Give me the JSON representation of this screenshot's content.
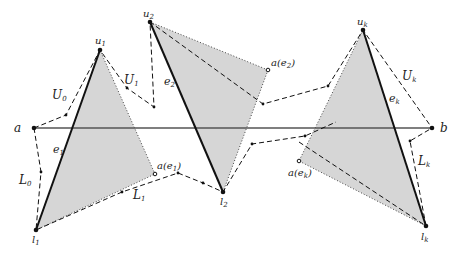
{
  "diagram": {
    "colors": {
      "fill": "#d6d6d6",
      "stroke": "#111111",
      "axis": "#555555"
    },
    "points": {
      "a": [
        34,
        128
      ],
      "b": [
        432,
        128
      ],
      "u1": [
        100,
        50
      ],
      "l1": [
        36,
        230
      ],
      "u2": [
        150,
        22
      ],
      "l2": [
        223,
        192
      ],
      "uk": [
        363,
        30
      ],
      "lk": [
        426,
        226
      ],
      "a_e1": [
        155,
        174
      ],
      "a_e2": [
        268,
        70
      ],
      "a_ek": [
        299,
        161
      ]
    },
    "labels": {
      "a": "a",
      "b": "b",
      "u1": "u",
      "u1_sub": "1",
      "u2": "u",
      "u2_sub": "2",
      "uk": "u",
      "uk_sub": "k",
      "l1": "l",
      "l1_sub": "1",
      "l2": "l",
      "l2_sub": "2",
      "lk": "l",
      "lk_sub": "k",
      "e1": "e",
      "e1_sub": "1",
      "e2": "e",
      "e2_sub": "2",
      "ek": "e",
      "ek_sub": "k",
      "U0": "U",
      "U0_sub": "0",
      "U1": "U",
      "U1_sub": "1",
      "Uk": "U",
      "Uk_sub": "k",
      "L0": "L",
      "L0_sub": "0",
      "L1": "L",
      "L1_sub": "1",
      "Lk": "L",
      "Lk_sub": "k",
      "a_e1": "a(e",
      "a_e1_sub": "1",
      "a_e1_close": ")",
      "a_e2": "a(e",
      "a_e2_sub": "2",
      "a_e2_close": ")",
      "a_ek": "a(e",
      "a_ek_sub": "k",
      "a_ek_close": ")"
    },
    "edges": [
      "e1",
      "e2",
      "ek"
    ],
    "chains": {
      "upper": "U0, U1, ..., Uk",
      "lower": "L0, L1, ..., Lk"
    }
  }
}
